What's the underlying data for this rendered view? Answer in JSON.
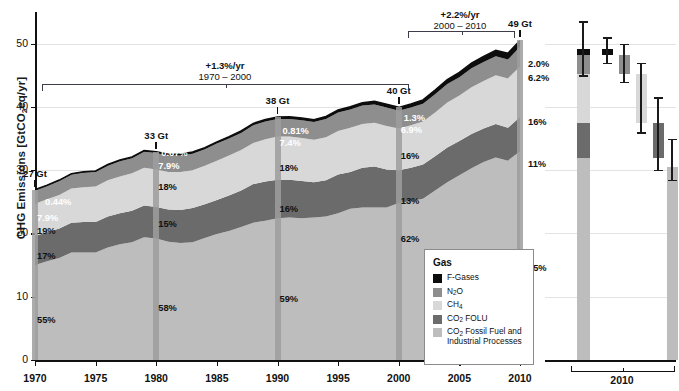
{
  "axes": {
    "y_label_main": "GHG Emissions [GtCO",
    "y_label_sub": "2",
    "y_label_tail": "eq/yr]",
    "y_ticks": [
      "0",
      "10",
      "20",
      "30",
      "40",
      "50"
    ],
    "y_range": [
      0,
      55
    ],
    "x_ticks": [
      "1970",
      "1975",
      "1980",
      "1985",
      "1990",
      "1995",
      "2000",
      "2005",
      "2010"
    ],
    "x_range": [
      1970,
      2010
    ],
    "right_panel_tick": "2010"
  },
  "annotations": {
    "bracket1": {
      "rate": "+1.3%/yr",
      "period": "1970 – 2000"
    },
    "bracket2": {
      "rate": "+2.2%/yr",
      "period": "2000 – 2010"
    },
    "callouts": [
      {
        "year": 1970,
        "label": "27 Gt"
      },
      {
        "year": 1980,
        "label": "33 Gt"
      },
      {
        "year": 1990,
        "label": "38 Gt"
      },
      {
        "year": 2000,
        "label": "40 Gt"
      },
      {
        "year": 2010,
        "label": "49 Gt"
      }
    ]
  },
  "legend": {
    "title": "Gas",
    "items": [
      {
        "name": "F-Gases",
        "label_pre": "F-Gases",
        "label_sub": "",
        "label_post": "",
        "color": "#0d0d0d"
      },
      {
        "name": "N2O",
        "label_pre": "N",
        "label_sub": "2",
        "label_post": "O",
        "color": "#8e8e8e"
      },
      {
        "name": "CH4",
        "label_pre": "CH",
        "label_sub": "4",
        "label_post": "",
        "color": "#d8d8d8"
      },
      {
        "name": "CO2-FOLU",
        "label_pre": "CO",
        "label_sub": "2",
        "label_post": " FOLU",
        "color": "#6b6b6b"
      },
      {
        "name": "CO2-FF",
        "label_pre": "CO",
        "label_sub": "2",
        "label_post": " Fossil Fuel and Industrial Processes",
        "color": "#bdbdbd"
      }
    ]
  },
  "share_labels": {
    "1970": {
      "f_gases": "0.44%",
      "n2o": "7.9%",
      "ch4": "19%",
      "co2_folu": "17%",
      "co2_ff": "55%"
    },
    "1980": {
      "f_gases": "0.67%",
      "n2o": "7.9%",
      "ch4": "18%",
      "co2_folu": "15%",
      "co2_ff": "58%"
    },
    "1990": {
      "f_gases": "0.81%",
      "n2o": "7.4%",
      "ch4": "18%",
      "co2_folu": "16%",
      "co2_ff": "59%"
    },
    "2000": {
      "f_gases": "1.3%",
      "n2o": "6.9%",
      "ch4": "16%",
      "co2_folu": "13%",
      "co2_ff": "62%"
    },
    "2010": {
      "f_gases": "2.0%",
      "n2o": "6.2%",
      "ch4": "16%",
      "co2_folu": "11%",
      "co2_ff": "65%"
    }
  },
  "chart_data": {
    "type": "area",
    "title": "",
    "xlabel": "",
    "ylabel": "GHG Emissions [GtCO2eq/yr]",
    "xlim": [
      1970,
      2010
    ],
    "ylim": [
      0,
      55
    ],
    "grid": "horizontal",
    "legend_position": "inside-bottom-right",
    "stack_order": [
      "CO2 Fossil Fuel and Industrial Processes",
      "CO2 FOLU",
      "CH4",
      "N2O",
      "F-Gases"
    ],
    "x": [
      1970,
      1971,
      1972,
      1973,
      1974,
      1975,
      1976,
      1977,
      1978,
      1979,
      1980,
      1981,
      1982,
      1983,
      1984,
      1985,
      1986,
      1987,
      1988,
      1989,
      1990,
      1991,
      1992,
      1993,
      1994,
      1995,
      1996,
      1997,
      1998,
      1999,
      2000,
      2001,
      2002,
      2003,
      2004,
      2005,
      2006,
      2007,
      2008,
      2009,
      2010
    ],
    "series": [
      {
        "name": "CO2 Fossil Fuel and Industrial Processes",
        "color": "#bdbdbd",
        "values": [
          15.0,
          15.6,
          16.1,
          17.0,
          17.0,
          17.0,
          17.8,
          18.3,
          18.6,
          19.4,
          19.2,
          18.7,
          18.5,
          18.6,
          19.3,
          19.9,
          20.4,
          21.0,
          21.7,
          22.0,
          22.4,
          22.5,
          22.4,
          22.5,
          22.7,
          23.2,
          23.9,
          24.1,
          24.1,
          24.1,
          24.8,
          25.1,
          25.5,
          26.8,
          28.1,
          29.2,
          30.3,
          31.3,
          32.0,
          31.5,
          33.0
        ]
      },
      {
        "name": "CO2 FOLU",
        "color": "#6b6b6b",
        "values": [
          4.6,
          4.6,
          4.7,
          4.7,
          4.8,
          4.8,
          4.9,
          4.9,
          5.0,
          5.0,
          5.0,
          5.1,
          5.2,
          5.4,
          5.3,
          5.4,
          5.6,
          5.8,
          6.1,
          6.2,
          6.1,
          6.0,
          5.9,
          5.6,
          5.7,
          6.1,
          5.8,
          6.3,
          6.5,
          6.0,
          5.2,
          5.3,
          5.4,
          5.4,
          5.5,
          5.4,
          5.4,
          5.3,
          5.3,
          5.2,
          5.4
        ]
      },
      {
        "name": "CH4",
        "color": "#d8d8d8",
        "values": [
          5.1,
          5.2,
          5.3,
          5.4,
          5.5,
          5.6,
          5.7,
          5.8,
          5.9,
          6.0,
          5.9,
          5.9,
          6.0,
          6.0,
          6.1,
          6.2,
          6.3,
          6.4,
          6.5,
          6.7,
          6.8,
          6.8,
          6.8,
          6.7,
          6.8,
          6.9,
          7.0,
          6.9,
          6.9,
          6.9,
          6.6,
          6.7,
          6.8,
          6.9,
          7.1,
          7.2,
          7.4,
          7.5,
          7.7,
          7.8,
          8.0
        ]
      },
      {
        "name": "N2O",
        "color": "#8e8e8e",
        "values": [
          2.1,
          2.1,
          2.2,
          2.2,
          2.3,
          2.3,
          2.3,
          2.4,
          2.4,
          2.5,
          2.6,
          2.6,
          2.6,
          2.6,
          2.6,
          2.7,
          2.7,
          2.7,
          2.8,
          2.8,
          2.8,
          2.8,
          2.8,
          2.8,
          2.9,
          2.9,
          2.9,
          2.9,
          2.9,
          2.9,
          2.8,
          2.8,
          2.8,
          2.9,
          2.9,
          2.9,
          3.0,
          3.0,
          3.0,
          3.0,
          3.1
        ]
      },
      {
        "name": "F-Gases",
        "color": "#0d0d0d",
        "values": [
          0.12,
          0.13,
          0.14,
          0.15,
          0.16,
          0.17,
          0.18,
          0.19,
          0.2,
          0.21,
          0.22,
          0.23,
          0.24,
          0.25,
          0.26,
          0.27,
          0.28,
          0.29,
          0.3,
          0.31,
          0.31,
          0.32,
          0.34,
          0.36,
          0.38,
          0.41,
          0.44,
          0.47,
          0.49,
          0.51,
          0.52,
          0.56,
          0.6,
          0.65,
          0.7,
          0.76,
          0.82,
          0.88,
          0.93,
          0.96,
          1.0
        ]
      }
    ],
    "totals": {
      "1970": 27,
      "1980": 33,
      "1990": 38,
      "2000": 40,
      "2010": 49
    },
    "right_panel": {
      "type": "bar",
      "group_label": "2010",
      "bars": [
        {
          "name": "total-2010-stacked",
          "total": 49,
          "segments": [
            {
              "name": "CO2 Fossil Fuel and Industrial Processes",
              "from": 0,
              "to": 32.0,
              "color": "#bdbdbd"
            },
            {
              "name": "CO2 FOLU",
              "from": 32.0,
              "to": 37.4,
              "color": "#6b6b6b"
            },
            {
              "name": "CH4",
              "from": 37.4,
              "to": 45.2,
              "color": "#d8d8d8"
            },
            {
              "name": "N2O",
              "from": 45.2,
              "to": 48.2,
              "color": "#8e8e8e"
            },
            {
              "name": "F-Gases",
              "from": 48.2,
              "to": 49.2,
              "color": "#0d0d0d"
            }
          ],
          "error_low": 45.0,
          "error_high": 53.5
        },
        {
          "name": "F-Gases-2010",
          "from": 48.2,
          "to": 49.2,
          "color": "#0d0d0d",
          "error_low": 47.0,
          "error_high": 51.0
        },
        {
          "name": "N2O-2010",
          "from": 45.2,
          "to": 48.2,
          "color": "#8e8e8e",
          "error_low": 44.0,
          "error_high": 50.0
        },
        {
          "name": "CH4-2010",
          "from": 37.4,
          "to": 45.2,
          "color": "#d8d8d8",
          "error_low": 36.0,
          "error_high": 47.0
        },
        {
          "name": "CO2-FOLU-2010",
          "from": 32.0,
          "to": 37.4,
          "color": "#6b6b6b",
          "error_low": 30.0,
          "error_high": 41.5
        },
        {
          "name": "CO2-FF-2010",
          "from": 0,
          "to": 30.5,
          "color": "#bdbdbd",
          "error_low": 28.5,
          "error_high": 35.0
        }
      ]
    }
  }
}
